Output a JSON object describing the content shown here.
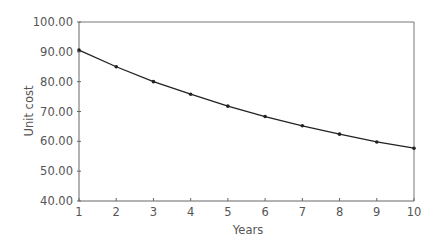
{
  "chart_data": {
    "type": "line",
    "title": "",
    "xlabel": "Years",
    "ylabel": "Unit cost",
    "x": [
      1,
      2,
      3,
      4,
      5,
      6,
      7,
      8,
      9,
      10
    ],
    "x_tick_labels": [
      "1",
      "2",
      "3",
      "4",
      "5",
      "6",
      "7",
      "8",
      "9",
      "10"
    ],
    "y_tick_labels": [
      "100.00",
      "90.00",
      "80.00",
      "70.00",
      "60.00",
      "50.00",
      "40.00"
    ],
    "y_ticks": [
      100,
      90,
      80,
      70,
      60,
      50,
      40
    ],
    "ylim": [
      40,
      100
    ],
    "xlim": [
      1,
      10
    ],
    "grid": false,
    "legend": null,
    "series": [
      {
        "name": "Unit cost",
        "values": [
          90.6,
          85.0,
          80.0,
          75.8,
          71.8,
          68.3,
          65.2,
          62.4,
          59.8,
          57.7
        ],
        "color": "#222222",
        "marker": "dot"
      }
    ]
  },
  "colors": {
    "axis": "#666666",
    "line": "#222222",
    "text": "#555555"
  }
}
